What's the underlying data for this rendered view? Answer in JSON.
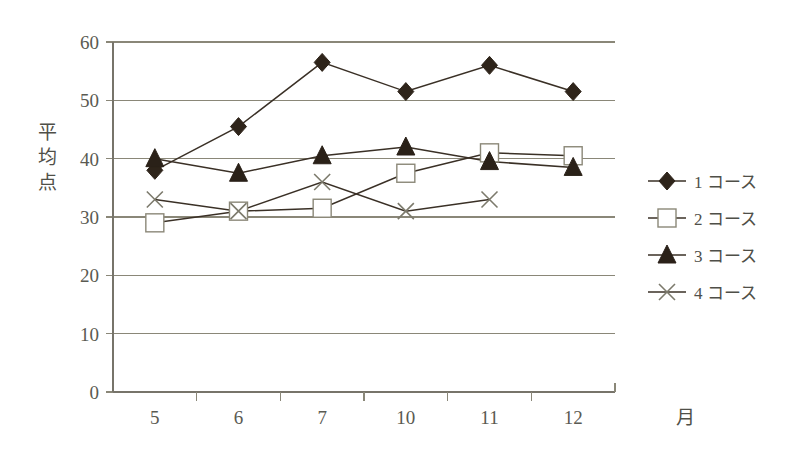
{
  "chart_data": {
    "type": "line",
    "title": "",
    "xlabel": "月",
    "ylabel": "平均点",
    "categories": [
      "5",
      "6",
      "7",
      "10",
      "11",
      "12"
    ],
    "ylim": [
      0,
      60
    ],
    "yticks": [
      0,
      10,
      20,
      30,
      40,
      50,
      60
    ],
    "grid": true,
    "legend_position": "right",
    "series": [
      {
        "name": "1 コース",
        "marker": "diamond-filled",
        "color": "#2e241a",
        "values": [
          38,
          45.5,
          56.5,
          51.5,
          56,
          51.5
        ]
      },
      {
        "name": "2 コース",
        "marker": "square-open",
        "color": "#8b8878",
        "values": [
          29,
          31,
          31.5,
          37.5,
          41,
          40.5
        ]
      },
      {
        "name": "3 コース",
        "marker": "triangle-filled",
        "color": "#2a2118",
        "values": [
          40,
          37.5,
          40.5,
          42,
          39.5,
          38.5
        ]
      },
      {
        "name": "4 コース",
        "marker": "x-cross",
        "color": "#7c7a6c",
        "values": [
          33,
          31,
          36,
          31,
          33,
          null
        ]
      }
    ]
  },
  "axis": {
    "y_tick_labels": [
      "60",
      "50",
      "40",
      "30",
      "20",
      "10",
      "0"
    ],
    "x_tick_labels": [
      "5",
      "6",
      "7",
      "10",
      "11",
      "12"
    ],
    "x_axis_unit": "月",
    "y_axis_title_chars": [
      "平",
      "均",
      "点"
    ]
  },
  "legend": {
    "items": [
      {
        "label": "1 コース",
        "marker": "diamond-filled"
      },
      {
        "label": "2 コース",
        "marker": "square-open"
      },
      {
        "label": "3 コース",
        "marker": "triangle-filled"
      },
      {
        "label": "4 コース",
        "marker": "x-cross"
      }
    ]
  },
  "colors": {
    "gridline": "#8a8778",
    "line": "#3a3026",
    "background": "#ffffff",
    "text": "#4f4f48"
  }
}
